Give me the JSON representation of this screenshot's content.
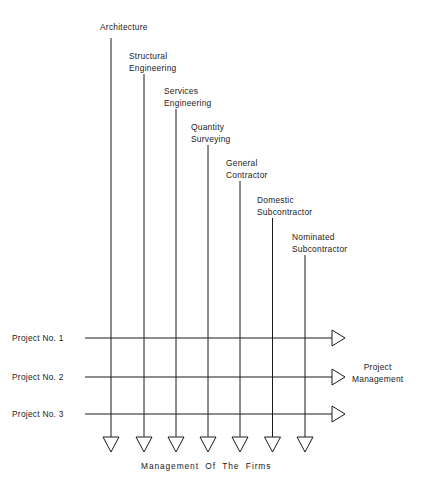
{
  "diagram": {
    "type": "matrix-organization-flow-diagram",
    "title_footer": "Management  Of  The  Firms",
    "outcome_label_line1": "Project",
    "outcome_label_line2": "Management",
    "stroke_color": "#1a1a1a",
    "background_color": "#ffffff",
    "disciplines": [
      {
        "id": "architecture",
        "line1": "Architecture",
        "line2": "",
        "x": 111,
        "label_x": 100,
        "label_y": 21,
        "line_top": 38
      },
      {
        "id": "structural-engineering",
        "line1": "Structural",
        "line2": "Engineering",
        "x": 144,
        "label_x": 129,
        "label_y": 50,
        "line_top": 74
      },
      {
        "id": "services-engineering",
        "line1": "Services",
        "line2": "Engineering",
        "x": 176,
        "label_x": 164,
        "label_y": 85,
        "line_top": 109
      },
      {
        "id": "quantity-surveying",
        "line1": "Quantity",
        "line2": "Surveying",
        "x": 208,
        "label_x": 191,
        "label_y": 121,
        "line_top": 145
      },
      {
        "id": "general-contractor",
        "line1": "General",
        "line2": "Contractor",
        "x": 240,
        "label_x": 226,
        "label_y": 157,
        "line_top": 181
      },
      {
        "id": "domestic-subcontractor",
        "line1": "Domestic",
        "line2": "Subcontractor",
        "x": 272.5,
        "label_x": 257,
        "label_y": 194,
        "line_top": 218
      },
      {
        "id": "nominated-subcontractor",
        "line1": "Nominated",
        "line2": "Subcontractor",
        "x": 305,
        "label_x": 292,
        "label_y": 231,
        "line_top": 255
      }
    ],
    "projects": [
      {
        "id": "project-1",
        "label": "Project No. 1",
        "y": 338,
        "label_x": 12,
        "label_y": 332
      },
      {
        "id": "project-2",
        "label": "Project No. 2",
        "y": 377,
        "label_x": 12,
        "label_y": 371
      },
      {
        "id": "project-3",
        "label": "Project No. 3",
        "y": 414,
        "label_x": 12,
        "label_y": 408
      }
    ],
    "geometry": {
      "project_line_start_x": 85,
      "project_arrow_tail_x": 332,
      "project_arrow_tip_x": 345,
      "project_arrow_half_height": 8,
      "vertical_line_bottom": 437,
      "down_arrow_tip_y": 452,
      "down_arrow_half_width": 8,
      "footer_x": 141,
      "footer_y": 460,
      "outcome_x": 352,
      "outcome_y": 361
    }
  }
}
